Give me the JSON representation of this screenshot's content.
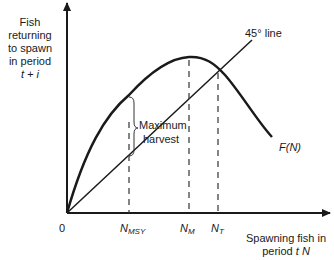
{
  "diagram": {
    "type": "fishery-stock-recruitment",
    "y_axis_label": {
      "line1": "Fish",
      "line2": "returning",
      "line3": "to spawn",
      "line4": "in period",
      "line5": "t + i"
    },
    "x_axis_label": {
      "line1": "Spawning fish in",
      "line2_prefix": "period ",
      "line2_var": "t  N"
    },
    "origin_label": "0",
    "ticks": [
      {
        "id": "nmsy",
        "base": "N",
        "sub": "MSY"
      },
      {
        "id": "nm",
        "base": "N",
        "sub": "M"
      },
      {
        "id": "nt",
        "base": "N",
        "sub": "T"
      }
    ],
    "line_label": "45° line",
    "curve_label": "F(N)",
    "brace_label": {
      "line1": "Maximum",
      "line2": "harvest"
    },
    "colors": {
      "ink": "#1a1a1a",
      "background": "#ffffff"
    }
  }
}
